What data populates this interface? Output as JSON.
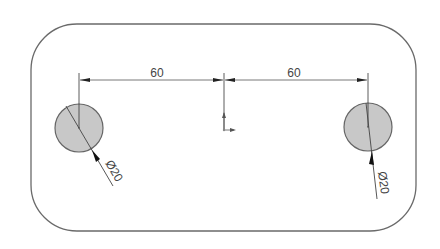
{
  "drawing": {
    "type": "2D sketch",
    "colors": {
      "outline": "#6a6a6a",
      "hole_fill": "#c8c8c8",
      "hole_stroke": "#666666",
      "dimension": "#333333",
      "background": "#ffffff"
    },
    "frame": {
      "shape": "rounded-rectangle"
    },
    "holes": [
      {
        "id": "left",
        "diameter_label": "Ø20"
      },
      {
        "id": "right",
        "diameter_label": "Ø20"
      }
    ],
    "dimensions": {
      "left_span": "60",
      "right_span": "60"
    },
    "origin": {
      "symbol": "origin-marker"
    }
  }
}
